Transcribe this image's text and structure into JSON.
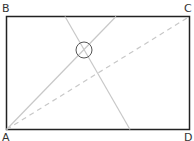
{
  "diagram": {
    "vertices": {
      "A": "A",
      "B": "B",
      "C": "C",
      "D": "D"
    },
    "colors": {
      "border": "#222222",
      "guide_lines": "#c8c8c8",
      "circle": "#555555"
    }
  }
}
